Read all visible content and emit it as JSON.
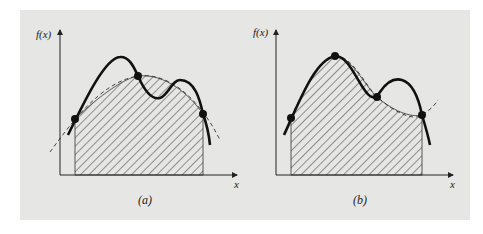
{
  "figure": {
    "panels": [
      {
        "id": "a",
        "caption": "(a)",
        "y_axis_label": "f(x)",
        "x_axis_label": "x",
        "description": "Function f(x) (solid) approximated by a quadratic through three points (dashed); hatched area is the integral approximation",
        "num_points": 3
      },
      {
        "id": "b",
        "caption": "(b)",
        "y_axis_label": "f(x)",
        "x_axis_label": "x",
        "description": "Function f(x) (solid) approximated by a cubic through four points (dashed); hatched area is the integral approximation",
        "num_points": 4
      }
    ],
    "colors": {
      "panel_background": "#e6e6e4",
      "curve": "#111111",
      "hatch": "#333333"
    }
  }
}
